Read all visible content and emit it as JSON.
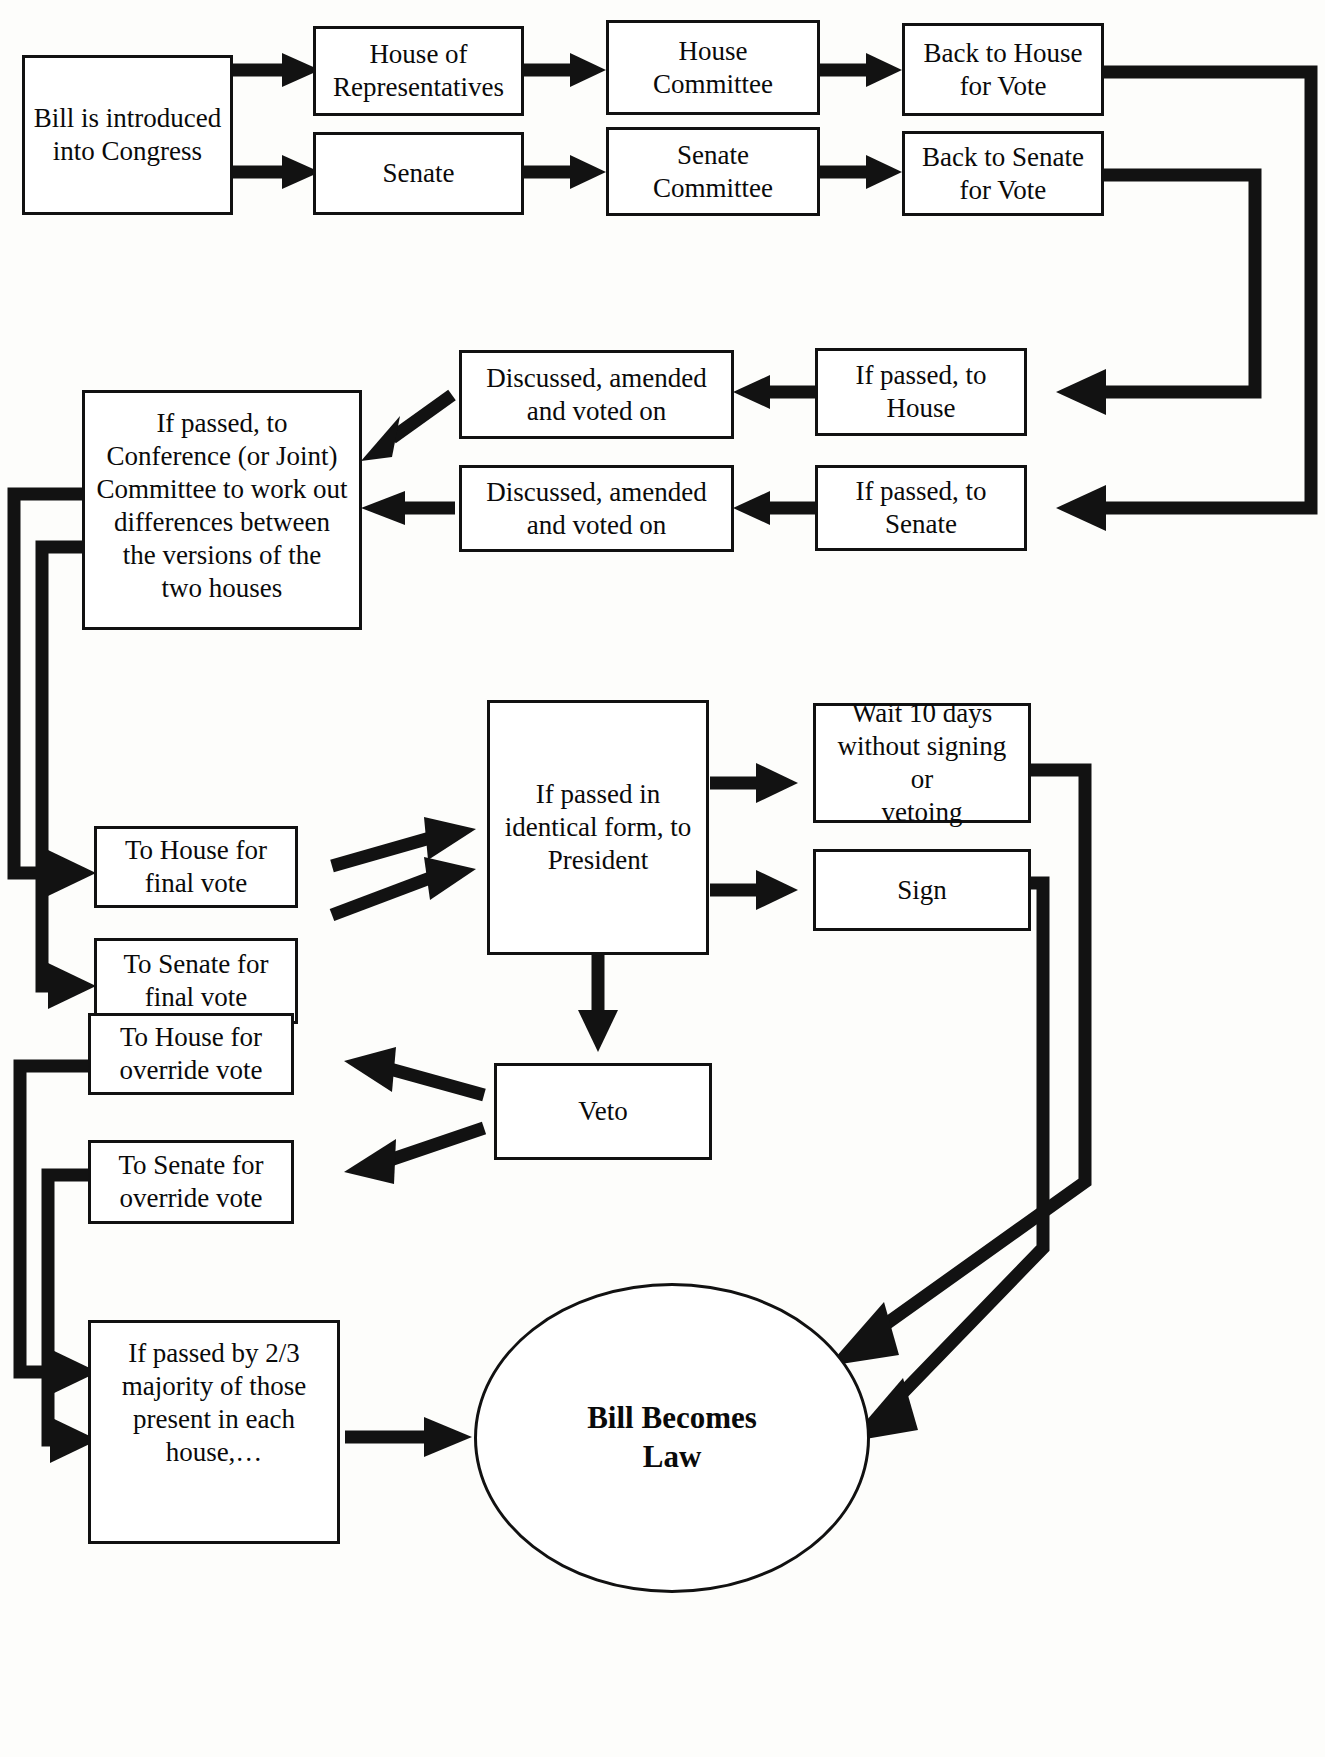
{
  "diagram": {
    "nodes": {
      "bill_introduced": "Bill is introduced\ninto Congress",
      "house_of_reps": "House of\nRepresentatives",
      "house_committee": "House\nCommittee",
      "back_to_house_vote": "Back to House\nfor Vote",
      "senate": "Senate",
      "senate_committee": "Senate\nCommittee",
      "back_to_senate_vote": "Back to Senate\nfor Vote",
      "if_passed_to_house": "If passed, to\nHouse",
      "if_passed_to_senate": "If passed, to\nSenate",
      "discussed_amended_1": "Discussed, amended\nand voted on",
      "discussed_amended_2": "Discussed, amended\nand voted on",
      "conference_committee": "If passed, to\nConference (or Joint)\nCommittee to work out\ndifferences between\nthe versions of the\ntwo houses",
      "to_house_final_vote": "To House for\nfinal vote",
      "to_senate_final_vote": "To Senate for\nfinal vote",
      "to_president": "If passed in\nidentical form, to\nPresident",
      "wait_ten_days": "Wait 10 days\nwithout signing or\nvetoing",
      "sign": "Sign",
      "veto": "Veto",
      "to_house_override": "To House for\noverride vote",
      "to_senate_override": "To Senate for\noverride vote",
      "two_thirds_majority": "If passed by 2/3\nmajority of those\npresent in each\nhouse,…",
      "bill_becomes_law": "Bill Becomes\nLaw"
    },
    "colors": {
      "stroke": "#121212",
      "box_fill": "#ffffff",
      "text": "#0a0a0a",
      "background": "#fdfdfb"
    },
    "edges": [
      {
        "from": "bill_introduced",
        "to": "house_of_reps",
        "style": "arrow"
      },
      {
        "from": "bill_introduced",
        "to": "senate",
        "style": "arrow"
      },
      {
        "from": "house_of_reps",
        "to": "house_committee",
        "style": "arrow"
      },
      {
        "from": "house_committee",
        "to": "back_to_house_vote",
        "style": "arrow"
      },
      {
        "from": "senate",
        "to": "senate_committee",
        "style": "arrow"
      },
      {
        "from": "senate_committee",
        "to": "back_to_senate_vote",
        "style": "arrow"
      },
      {
        "from": "back_to_house_vote",
        "to": "if_passed_to_senate",
        "style": "elbow"
      },
      {
        "from": "back_to_senate_vote",
        "to": "if_passed_to_house",
        "style": "elbow"
      },
      {
        "from": "if_passed_to_house",
        "to": "discussed_amended_1",
        "style": "arrow"
      },
      {
        "from": "if_passed_to_senate",
        "to": "discussed_amended_2",
        "style": "arrow"
      },
      {
        "from": "discussed_amended_1",
        "to": "conference_committee",
        "style": "diagonal"
      },
      {
        "from": "discussed_amended_2",
        "to": "conference_committee",
        "style": "arrow"
      },
      {
        "from": "conference_committee",
        "to": "to_house_final_vote",
        "style": "elbow"
      },
      {
        "from": "conference_committee",
        "to": "to_senate_final_vote",
        "style": "elbow"
      },
      {
        "from": "to_house_final_vote",
        "to": "to_president",
        "style": "diagonal"
      },
      {
        "from": "to_senate_final_vote",
        "to": "to_president",
        "style": "diagonal"
      },
      {
        "from": "to_president",
        "to": "wait_ten_days",
        "style": "arrow"
      },
      {
        "from": "to_president",
        "to": "sign",
        "style": "arrow"
      },
      {
        "from": "to_president",
        "to": "veto",
        "style": "arrow-down"
      },
      {
        "from": "veto",
        "to": "to_house_override",
        "style": "diagonal"
      },
      {
        "from": "veto",
        "to": "to_senate_override",
        "style": "diagonal"
      },
      {
        "from": "to_house_override",
        "to": "two_thirds_majority",
        "style": "elbow"
      },
      {
        "from": "to_senate_override",
        "to": "two_thirds_majority",
        "style": "elbow"
      },
      {
        "from": "two_thirds_majority",
        "to": "bill_becomes_law",
        "style": "arrow"
      },
      {
        "from": "wait_ten_days",
        "to": "bill_becomes_law",
        "style": "elbow-diagonal"
      },
      {
        "from": "sign",
        "to": "bill_becomes_law",
        "style": "elbow-diagonal"
      }
    ]
  }
}
